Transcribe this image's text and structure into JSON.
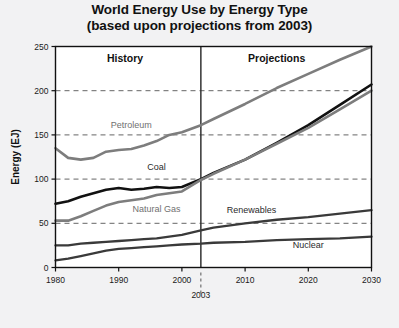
{
  "chart_data": {
    "type": "line",
    "title": "World Energy Use by Energy Type",
    "subtitle": "(based upon projections from 2003)",
    "xlabel": "",
    "ylabel": "Energy (EJ)",
    "xlim": [
      1980,
      2030
    ],
    "ylim": [
      0,
      250
    ],
    "xticks": [
      1980,
      1990,
      2000,
      2010,
      2020,
      2030
    ],
    "xtick_labels": [
      "1980",
      "1990",
      "2000",
      "2010",
      "2020",
      "2030"
    ],
    "yticks": [
      0,
      50,
      100,
      150,
      200,
      250
    ],
    "ytick_labels": [
      "0",
      "50",
      "100",
      "150",
      "200",
      "250"
    ],
    "grid": "horizontal-dashed",
    "legend": "inline-labels",
    "annotations": [
      {
        "name": "history-region",
        "text": "History",
        "x": 1991,
        "y": 232
      },
      {
        "name": "projections-region",
        "text": "Projections",
        "x": 2015,
        "y": 232
      },
      {
        "name": "divider-year",
        "text": "2003",
        "x": 2003,
        "y": -24
      }
    ],
    "divider_x": 2003,
    "x": [
      1980,
      1982,
      1984,
      1986,
      1988,
      1990,
      1992,
      1994,
      1996,
      1998,
      2000,
      2003,
      2005,
      2010,
      2015,
      2020,
      2025,
      2030
    ],
    "series": [
      {
        "name": "Petroleum",
        "color": "#7d7d7d",
        "width": 2.6,
        "label_x": 1992,
        "label_y": 158,
        "values": [
          135,
          124,
          122,
          124,
          131,
          133,
          134,
          138,
          143,
          150,
          153,
          161,
          168,
          185,
          203,
          219,
          235,
          250
        ]
      },
      {
        "name": "Coal",
        "color": "#111111",
        "width": 2.6,
        "label_x": 1996,
        "label_y": 110,
        "values": [
          72,
          75,
          80,
          84,
          88,
          90,
          88,
          89,
          91,
          90,
          91,
          100,
          107,
          122,
          141,
          161,
          184,
          207
        ]
      },
      {
        "name": "Natural Gas",
        "color": "#7d7d7d",
        "width": 2.6,
        "label_x": 1996,
        "label_y": 63,
        "values": [
          53,
          53,
          58,
          64,
          70,
          74,
          76,
          78,
          82,
          84,
          86,
          99,
          106,
          122,
          140,
          158,
          179,
          200
        ]
      },
      {
        "name": "Renewables",
        "color": "#3a3a3a",
        "width": 2.3,
        "label_x": 2011,
        "label_y": 62,
        "values": [
          25,
          25,
          27,
          28,
          29,
          30,
          31,
          32,
          33,
          35,
          37,
          42,
          45,
          50,
          54,
          57,
          61,
          65
        ]
      },
      {
        "name": "Nuclear",
        "color": "#3a3a3a",
        "width": 2.3,
        "label_x": 2020,
        "label_y": 22,
        "values": [
          8,
          10,
          13,
          16,
          19,
          21,
          22,
          23,
          24,
          25,
          26,
          27,
          28,
          29,
          31,
          32,
          33,
          35
        ]
      }
    ]
  },
  "style": {
    "background": "#f2f2f3",
    "plot_background": "#ffffff",
    "axis_color": "#111111",
    "grid_color": "#555555"
  }
}
